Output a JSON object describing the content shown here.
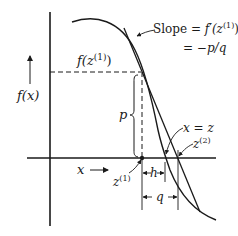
{
  "diagram": {
    "labels": {
      "y_axis": "f(x)",
      "x_axis": "x",
      "f_z1": "f(z",
      "f_z1_sup": "(1)",
      "f_z1_close": ")",
      "slope_prefix": "Slope = ",
      "slope_f": "f′(z",
      "slope_sup": "(1)",
      "slope_close": ")",
      "slope_line2": "= −p/q",
      "p": "p",
      "h": "h",
      "q": "q",
      "x_eq_z": "x = z",
      "z1": "z",
      "z1_sup": "(1)",
      "z2": "z",
      "z2_sup": "(2)"
    },
    "colors": {
      "ink": "#1a1a1a",
      "background": "#ffffff"
    },
    "geometry": {
      "y_axis_x": 50,
      "x_axis_y": 158,
      "tangent_point": [
        141,
        72
      ],
      "root_x": 165,
      "newton_next_x": 178
    }
  }
}
